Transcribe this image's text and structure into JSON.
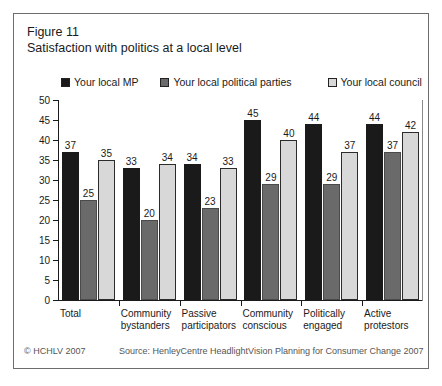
{
  "figure": {
    "label": "Figure 11",
    "title": "Satisfaction with politics at a local level"
  },
  "footer": {
    "copyright": "© HCHLV 2007",
    "source": "Source: HenleyCentre HeadlightVision Planning for Consumer Change 2007"
  },
  "colors": {
    "series_local_mp": "#1a1a1a",
    "series_local_political_parties": "#6a6a6a",
    "series_local_council": "#d8d8d8",
    "axis": "#1a1a1a",
    "border": "#6d6d6d",
    "footer_text": "#555555"
  },
  "chart_data": {
    "type": "bar",
    "title": "Satisfaction with politics at a local level",
    "xlabel": "",
    "ylabel": "",
    "ylim": [
      0,
      50
    ],
    "yticks": [
      0,
      5,
      10,
      15,
      20,
      25,
      30,
      35,
      40,
      45,
      50
    ],
    "grid": false,
    "legend_position": "top",
    "categories": [
      "Total",
      "Community bystanders",
      "Passive participators",
      "Community conscious",
      "Politically engaged",
      "Active protestors"
    ],
    "category_lines": [
      [
        "Total"
      ],
      [
        "Community",
        "bystanders"
      ],
      [
        "Passive",
        "participators"
      ],
      [
        "Community",
        "conscious"
      ],
      [
        "Politically",
        "engaged"
      ],
      [
        "Active",
        "protestors"
      ]
    ],
    "series": [
      {
        "name": "Your local MP",
        "color": "#1a1a1a",
        "values": [
          37,
          33,
          34,
          45,
          44,
          44
        ]
      },
      {
        "name": "Your local political parties",
        "color": "#6a6a6a",
        "values": [
          25,
          20,
          23,
          29,
          29,
          37
        ]
      },
      {
        "name": "Your local council",
        "color": "#d8d8d8",
        "values": [
          35,
          34,
          33,
          40,
          37,
          42
        ]
      }
    ]
  }
}
